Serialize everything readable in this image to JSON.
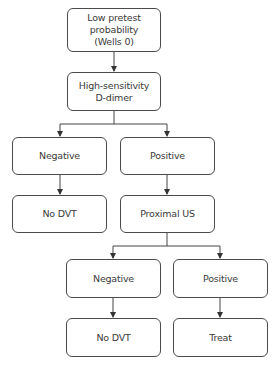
{
  "nodes": {
    "start": "Low pretest\nprobability\n(Wells 0)",
    "ddimer": "High-sensitivity\nD-dimer",
    "ddimer_negative": "Negative",
    "ddimer_positive": "Positive",
    "no_dvt_1": "No DVT",
    "proximal_us": "Proximal US",
    "us_negative": "Negative",
    "us_positive": "Positive",
    "no_dvt_2": "No DVT",
    "treat": "Treat"
  },
  "colors": {
    "stroke": "#4a4a4a",
    "text": "#3a3a3a",
    "background": "#ffffff"
  }
}
